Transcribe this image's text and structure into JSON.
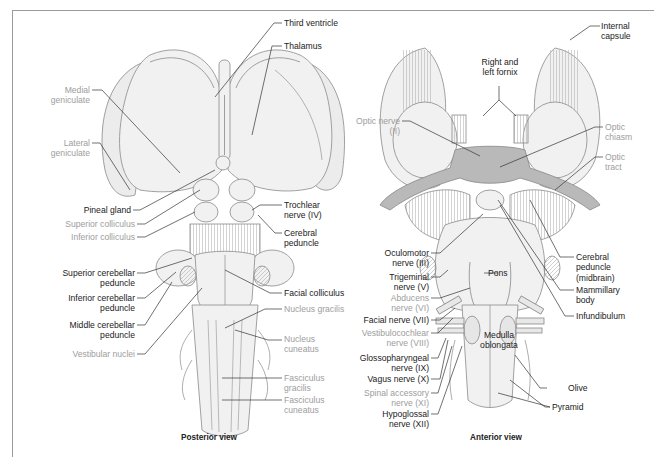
{
  "colors": {
    "label_dark": "#222222",
    "label_gray": "#9d9d9d",
    "frame": "#9a9a9a",
    "optic_tract": "#b9b9b9",
    "tissue_fill": "#f1f1f1",
    "tissue_stroke": "#8a8a8a"
  },
  "posterior": {
    "caption": "Posterior view",
    "labels": {
      "third_ventricle": "Third ventricle",
      "thalamus": "Thalamus",
      "medial_geniculate": "Medial\ngeniculate",
      "lateral_geniculate": "Lateral\ngeniculate",
      "pineal_gland": "Pineal gland",
      "superior_colliculus": "Superior colliculus",
      "inferior_colliculus": "Inferior colliculus",
      "trochlear_nerve": "Trochlear\nnerve (IV)",
      "cerebral_peduncle": "Cerebral\npeduncle",
      "superior_cerebellar_peduncle": "Superior cerebellar\npeduncle",
      "inferior_cerebellar_peduncle": "Inferior cerebellar\npeduncle",
      "middle_cerebellar_peduncle": "Middle cerebellar\npeduncle",
      "vestibular_nuclei": "Vestibular nuclei",
      "facial_colliculus": "Facial colliculus",
      "nucleus_gracilis": "Nucleus gracilis",
      "nucleus_cuneatus": "Nucleus\ncuneatus",
      "fasciculus_gracilis": "Fasciculus\ngracilis",
      "fasciculus_cuneatus": "Fasciculus\ncuneatus"
    }
  },
  "anterior": {
    "caption": "Anterior view",
    "labels": {
      "fornix": "Right and\nleft fornix",
      "internal_capsule": "Internal\ncapsule",
      "optic_nerve": "Optic nerve\n(II)",
      "optic_chiasm": "Optic\nchiasm",
      "optic_tract": "Optic\ntract",
      "oculomotor_nerve": "Oculomotor\nnerve (III)",
      "trigeminal_nerve": "Trigeminal\nnerve (V)",
      "abducens_nerve": "Abducens\nnerve (VI)",
      "facial_nerve": "Facial nerve (VII)",
      "vestibulocochlear_nerve": "Vestibulocochlear\nnerve (VIII)",
      "glossopharyngeal_nerve": "Glossopharyngeal\nnerve (IX)",
      "vagus_nerve": "Vagus nerve (X)",
      "spinal_accessory_nerve": "Spinal accessory\nnerve (XI)",
      "hypoglossal_nerve": "Hypoglossal\nnerve (XII)",
      "pons": "Pons",
      "medulla_oblongata": "Medulla\noblongata",
      "cerebral_peduncle": "Cerebral\npeduncle\n(midbrain)",
      "mammillary_body": "Mammillary\nbody",
      "infundibulum": "Infundibulum",
      "olive": "Olive",
      "pyramid": "Pyramid"
    }
  }
}
